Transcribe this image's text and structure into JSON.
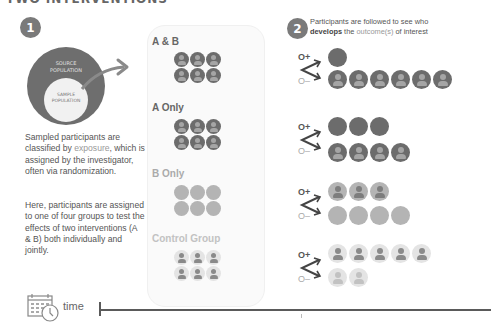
{
  "title": "TWO INTERVENTIONS",
  "step1": {
    "badge": "1",
    "source_label_1": "SOURCE",
    "source_label_2": "POPULATION",
    "sample_label_1": "SAMPLE",
    "sample_label_2": "POPULATION",
    "paragraph1": {
      "pre": "Sampled participants are classified by ",
      "highlight": "exposure",
      "post": ", which is assigned by the investigator, often via randomization."
    },
    "paragraph2": "Here, participants are assigned to one of four groups to test the effects of two interventions (A & B) both individually and jointly."
  },
  "groups": [
    {
      "label": "A & B",
      "color": "#6c6c6c",
      "count": 6,
      "style": "dark",
      "icons": true
    },
    {
      "label": "A Only",
      "color": "#6c6c6c",
      "count": 6,
      "style": "dark",
      "icons": true
    },
    {
      "label": "B Only",
      "color": "#b4b4b4",
      "count": 6,
      "style": "mid",
      "icons": false
    },
    {
      "label": "Control Group",
      "color": "#c4c4c4",
      "count": 6,
      "style": "light",
      "icons": true
    }
  ],
  "step2": {
    "badge": "2",
    "text_line1": "Participants are followed to see who",
    "text_bold": "develops",
    "text_mid": " the ",
    "text_highlight": "outcome(s)",
    "text_end": " of interest",
    "o_plus": "O+",
    "o_minus": "O–",
    "outcomes": [
      {
        "group": "A & B",
        "positive": 1,
        "negative": 6
      },
      {
        "group": "A Only",
        "positive": 3,
        "negative": 4
      },
      {
        "group": "B Only",
        "positive": 3,
        "negative": 4
      },
      {
        "group": "Control Group",
        "positive": 5,
        "negative": 2
      }
    ]
  },
  "timeline": {
    "label": "time"
  }
}
